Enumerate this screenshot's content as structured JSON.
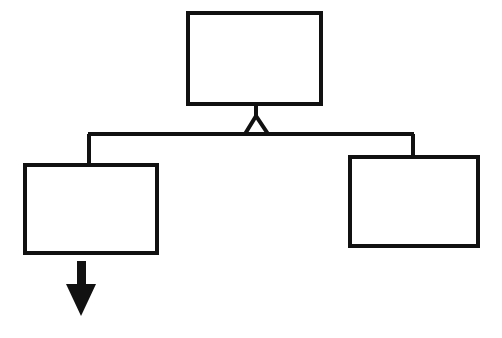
{
  "diagram": {
    "canvas": {
      "width": 502,
      "height": 338,
      "background_color": "#ffffff"
    },
    "style": {
      "stroke_color": "#111111",
      "fill_color": "#ffffff",
      "arrow_fill_color": "#111111",
      "box_stroke_width": 4,
      "connector_stroke_width": 4
    },
    "nodes": [
      {
        "id": "node-top",
        "name": "top-block",
        "label": "",
        "x": 188,
        "y": 13,
        "width": 133,
        "height": 91
      },
      {
        "id": "node-left",
        "name": "left-block",
        "label": "",
        "x": 25,
        "y": 165,
        "width": 132,
        "height": 88
      },
      {
        "id": "node-right",
        "name": "right-block",
        "label": "",
        "x": 350,
        "y": 157,
        "width": 128,
        "height": 89
      }
    ],
    "connectors": [
      {
        "id": "stem-top",
        "name": "top-block-stem",
        "type": "vertical-line",
        "from": "node-top",
        "points": "256,104 256,118"
      },
      {
        "id": "junction-triangle",
        "name": "bus-junction-triangle",
        "type": "triangle-outline",
        "points": "256,116 245,134 268,134"
      },
      {
        "id": "bus-horizontal",
        "name": "horizontal-bus-line",
        "type": "horizontal-line",
        "points": "88,134 414,134"
      },
      {
        "id": "leg-left",
        "name": "left-branch-drop-line",
        "type": "vertical-line",
        "to": "node-left",
        "points": "89,134 89,166"
      },
      {
        "id": "leg-right",
        "name": "right-branch-drop-line",
        "type": "vertical-line",
        "to": "node-right",
        "points": "413,134 413,158"
      }
    ],
    "arrow": {
      "id": "output-arrow",
      "name": "output-arrow-down",
      "direction": "down",
      "from": "node-left",
      "shaft": {
        "x": 77,
        "y": 261,
        "width": 9,
        "height": 24
      },
      "head": {
        "left_x": 66,
        "right_x": 96,
        "top_y": 284,
        "tip_x": 81,
        "tip_y": 316
      }
    }
  }
}
